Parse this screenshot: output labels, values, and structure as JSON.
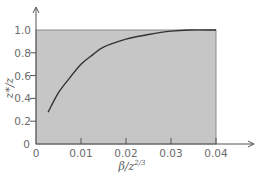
{
  "chart_data": {
    "type": "line",
    "title": "",
    "xlabel": "β/z^{2/3}",
    "ylabel": "z*/z",
    "xlabel_parts": {
      "base": "β/z",
      "sup": "2/3"
    },
    "ylabel_parts": {
      "text": "z*/z"
    },
    "xlim": [
      0,
      0.04
    ],
    "ylim": [
      0,
      1.0
    ],
    "x_ticks": [
      0,
      0.01,
      0.02,
      0.03,
      0.04
    ],
    "x_tick_labels": [
      "0",
      "0.01",
      "0.02",
      "0.03",
      "0.04"
    ],
    "y_ticks": [
      0,
      0.2,
      0.4,
      0.6,
      0.8,
      1.0
    ],
    "y_tick_labels": [
      "0",
      "0.2",
      "0.4",
      "0.6",
      "0.8",
      "1.0"
    ],
    "grid": false,
    "legend": null,
    "shaded_region": {
      "x": [
        0,
        0.04
      ],
      "y": [
        0,
        1.0
      ],
      "color": "#c6c6c6"
    },
    "series": [
      {
        "name": "z*/z",
        "x": [
          0.0027,
          0.005,
          0.0075,
          0.01,
          0.0125,
          0.015,
          0.02,
          0.025,
          0.03,
          0.034,
          0.04
        ],
        "y": [
          0.28,
          0.45,
          0.58,
          0.7,
          0.78,
          0.85,
          0.92,
          0.96,
          0.99,
          1.0,
          1.0
        ],
        "color": "#333333"
      }
    ]
  },
  "colors": {
    "background": "#ffffff",
    "plot_fill": "#c6c6c6",
    "axis": "#555555",
    "curve": "#333333",
    "text": "#6b6b6b"
  }
}
